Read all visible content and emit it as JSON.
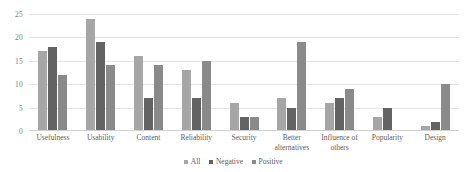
{
  "chart_data": {
    "type": "bar",
    "title": "",
    "subtitle": "",
    "xlabel": "",
    "ylabel": "",
    "ylim": [
      0,
      25
    ],
    "yticks": [
      0,
      5,
      10,
      15,
      20,
      25
    ],
    "grid": true,
    "legend_position": "bottom",
    "categories": [
      "Usefulness",
      "Usability",
      "Content",
      "Reliability",
      "Security",
      "Better alternatives",
      "Influence of others",
      "Popularity",
      "Design"
    ],
    "series": [
      {
        "name": "All",
        "color": "#a6a6a6",
        "values": [
          17,
          24,
          16,
          13,
          6,
          7,
          6,
          3,
          1
        ]
      },
      {
        "name": "Negative",
        "color": "#636363",
        "values": [
          18,
          19,
          7,
          7,
          3,
          5,
          7,
          5,
          2
        ]
      },
      {
        "name": "Positive",
        "color": "#8a8a8a",
        "values": [
          12,
          14,
          14,
          15,
          3,
          19,
          9,
          null,
          10
        ]
      }
    ]
  },
  "legend": {
    "items": [
      {
        "label": "All"
      },
      {
        "label": "Negative"
      },
      {
        "label": "Positive"
      }
    ]
  },
  "axis": {
    "y_tick_labels": [
      "25",
      "20",
      "15",
      "10",
      "5",
      "0"
    ]
  }
}
